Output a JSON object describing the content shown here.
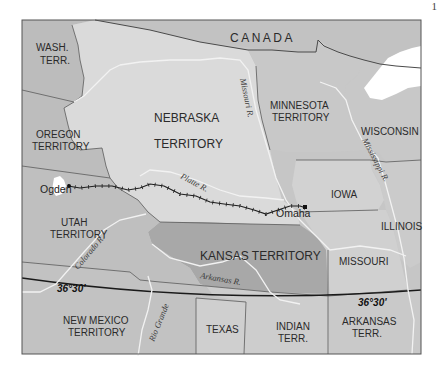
{
  "page": {
    "number_fragment": "1"
  },
  "map": {
    "title": "",
    "countries": [
      {
        "name": "CANADA"
      }
    ],
    "territories": [
      {
        "id": "wash",
        "line1": "WASH.",
        "line2": "TERR."
      },
      {
        "id": "oregon",
        "line1": "OREGON",
        "line2": "TERRITORY"
      },
      {
        "id": "nebraska",
        "line1": "NEBRASKA",
        "line2": "TERRITORY"
      },
      {
        "id": "minnesota",
        "line1": "MINNESOTA",
        "line2": "TERRITORY"
      },
      {
        "id": "utah",
        "line1": "UTAH",
        "line2": "TERRITORY"
      },
      {
        "id": "kansas",
        "line1": "KANSAS TERRITORY"
      },
      {
        "id": "new_mexico",
        "line1": "NEW MEXICO",
        "line2": "TERRITORY"
      },
      {
        "id": "indian",
        "line1": "INDIAN",
        "line2": "TERR."
      },
      {
        "id": "arkansas",
        "line1": "ARKANSAS",
        "line2": "TERR."
      }
    ],
    "states": [
      {
        "id": "wisconsin",
        "name": "WISCONSIN"
      },
      {
        "id": "iowa",
        "name": "IOWA"
      },
      {
        "id": "illinois",
        "name": "ILLINOIS"
      },
      {
        "id": "missouri",
        "name": "MISSOURI"
      },
      {
        "id": "texas",
        "name": "TEXAS"
      }
    ],
    "rivers": [
      {
        "id": "missouri_r",
        "name": "Missouri R."
      },
      {
        "id": "mississippi_r",
        "name": "Mississippi R."
      },
      {
        "id": "platte_r",
        "name": "Platte R."
      },
      {
        "id": "colorado_r",
        "name": "Colorado R."
      },
      {
        "id": "arkansas_r",
        "name": "Arkansas R."
      },
      {
        "id": "rio_grande",
        "name": "Rio Grande"
      }
    ],
    "cities": [
      {
        "id": "ogden",
        "name": "Ogden"
      },
      {
        "id": "omaha",
        "name": "Omaha"
      }
    ],
    "latitude_lines": [
      {
        "label_west": "36°30'",
        "label_east": "36°30'"
      }
    ],
    "route": {
      "from": "Ogden",
      "to": "Omaha",
      "style": "railroad"
    },
    "colors": {
      "background": "#ffffff",
      "frame": "#555555",
      "land_dark": "#bdbdbd",
      "land_light": "#d4d4d4",
      "nebraska": "#dcdcdc",
      "kansas": "#a9a9a9",
      "water": "#ffffff",
      "border": "#4a4a4a",
      "river": "#f4f4f4",
      "route": "#1e1e1e"
    }
  }
}
